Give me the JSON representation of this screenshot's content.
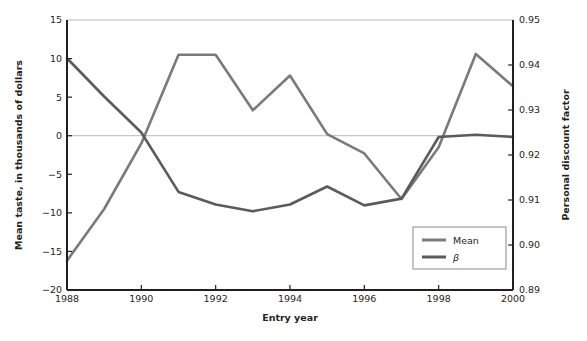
{
  "figure": {
    "xlabel": "Entry year",
    "ylabel_left": "Mean taste, in thousands of dollars",
    "ylabel_right": "Personal discount factor"
  },
  "legend": {
    "items": [
      {
        "label": "Mean",
        "color": "#7a7a7a"
      },
      {
        "label": "β",
        "color": "#5b5b5b"
      }
    ]
  },
  "axes": {
    "x_ticks": [
      "1988",
      "1990",
      "1992",
      "1994",
      "1996",
      "1998",
      "2000"
    ],
    "y_left_ticks": [
      "15",
      "10",
      "5",
      "0",
      "−5",
      "−10",
      "−15",
      "−20"
    ],
    "y_right_ticks": [
      "0.95",
      "0.94",
      "0.93",
      "0.92",
      "0.91",
      "0.90",
      "0.89"
    ]
  },
  "colors": {
    "mean_line": "#7a7a7a",
    "beta_line": "#5b5b5b",
    "axis": "#231f20",
    "gridline": "#b9b9b9",
    "background": "#ffffff"
  },
  "chart_data": {
    "type": "line",
    "title": "",
    "xlabel": "Entry year",
    "ylabel": "Mean taste, in thousands of dollars",
    "ylabel_secondary": "Personal discount factor",
    "x": [
      1988,
      1989,
      1990,
      1991,
      1992,
      1993,
      1994,
      1995,
      1996,
      1997,
      1998,
      1999,
      2000
    ],
    "xlim": [
      1988,
      2000
    ],
    "ylim": [
      -20,
      15
    ],
    "ylim_secondary": [
      0.89,
      0.95
    ],
    "grid": "horizontal-at-0-and-15",
    "legend_position": "inside-lower-right",
    "series": [
      {
        "name": "Mean",
        "axis": "left",
        "color": "#7a7a7a",
        "values": [
          -16.2,
          -9.5,
          -1.0,
          10.5,
          10.5,
          3.3,
          7.8,
          0.2,
          -2.3,
          -8.2,
          -1.5,
          10.6,
          6.4
        ]
      },
      {
        "name": "β",
        "axis": "right",
        "color": "#5b5b5b",
        "values": [
          0.9415,
          0.933,
          0.925,
          0.9118,
          0.909,
          0.9075,
          0.909,
          0.913,
          0.9088,
          0.9103,
          0.924,
          0.9245,
          0.924
        ]
      }
    ]
  }
}
